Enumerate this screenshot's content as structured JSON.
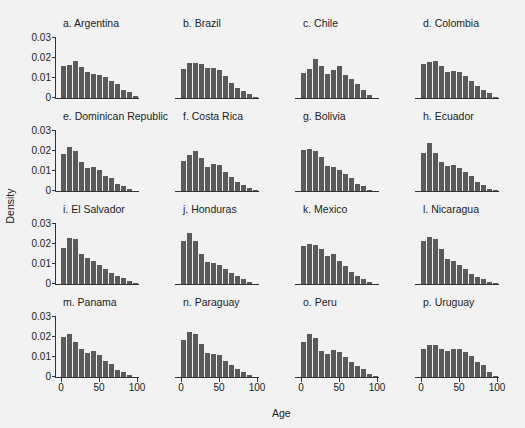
{
  "chart_data": {
    "type": "bar",
    "title": "",
    "xlabel": "Age",
    "ylabel": "Density",
    "ylim": [
      0,
      0.03
    ],
    "xlim": [
      0,
      100
    ],
    "yticks": [
      "0.03",
      "0.02",
      "0.01",
      "0"
    ],
    "xticks": [
      "0",
      "50",
      "100"
    ],
    "bin_width": 7.5,
    "panels": [
      {
        "label": "a. Argentina",
        "values": [
          0.0158,
          0.0163,
          0.0185,
          0.0157,
          0.013,
          0.0122,
          0.0115,
          0.0105,
          0.0085,
          0.0068,
          0.004,
          0.003,
          0.001
        ]
      },
      {
        "label": "b. Brazil",
        "values": [
          0.0145,
          0.0175,
          0.0175,
          0.0168,
          0.015,
          0.015,
          0.014,
          0.011,
          0.0075,
          0.005,
          0.0035,
          0.002,
          0.0005
        ]
      },
      {
        "label": "c. Chile",
        "values": [
          0.0125,
          0.0145,
          0.0195,
          0.016,
          0.0122,
          0.0138,
          0.016,
          0.0115,
          0.0095,
          0.0068,
          0.004,
          0.0015,
          0.0002
        ]
      },
      {
        "label": "d. Colombia",
        "values": [
          0.017,
          0.018,
          0.0185,
          0.0158,
          0.013,
          0.0135,
          0.013,
          0.011,
          0.0085,
          0.0062,
          0.004,
          0.0025,
          0.0005
        ]
      },
      {
        "label": "e. Dominican Republic",
        "values": [
          0.0185,
          0.022,
          0.02,
          0.0145,
          0.0115,
          0.0118,
          0.0105,
          0.0075,
          0.0065,
          0.0035,
          0.0025,
          0.001,
          0.0002
        ]
      },
      {
        "label": "f. Costa Rica",
        "values": [
          0.015,
          0.018,
          0.02,
          0.0165,
          0.012,
          0.0135,
          0.013,
          0.0095,
          0.007,
          0.0045,
          0.003,
          0.0015,
          0.0003
        ]
      },
      {
        "label": "g. Bolivia",
        "values": [
          0.0205,
          0.021,
          0.02,
          0.017,
          0.0125,
          0.012,
          0.0105,
          0.0085,
          0.0065,
          0.0035,
          0.0025,
          0.0005,
          0
        ]
      },
      {
        "label": "h. Ecuador",
        "values": [
          0.019,
          0.024,
          0.019,
          0.0145,
          0.0125,
          0.013,
          0.0115,
          0.0095,
          0.0075,
          0.0045,
          0.003,
          0.0012,
          0.0003
        ]
      },
      {
        "label": "i. El Salvador",
        "values": [
          0.018,
          0.023,
          0.0225,
          0.015,
          0.013,
          0.0115,
          0.0095,
          0.0075,
          0.0055,
          0.004,
          0.003,
          0.0015,
          0.0005
        ]
      },
      {
        "label": "j. Honduras",
        "values": [
          0.0215,
          0.0255,
          0.0215,
          0.015,
          0.011,
          0.0105,
          0.0095,
          0.0075,
          0.0055,
          0.004,
          0.0025,
          0.001,
          0.0002
        ]
      },
      {
        "label": "k. Mexico",
        "values": [
          0.019,
          0.02,
          0.0195,
          0.0175,
          0.014,
          0.015,
          0.0115,
          0.009,
          0.006,
          0.004,
          0.0025,
          0.001,
          0.0002
        ]
      },
      {
        "label": "l. Nicaragua",
        "values": [
          0.0215,
          0.0235,
          0.0225,
          0.0175,
          0.0125,
          0.0115,
          0.0095,
          0.0075,
          0.005,
          0.0035,
          0.0025,
          0.001,
          0.0003
        ]
      },
      {
        "label": "m. Panama",
        "values": [
          0.02,
          0.0215,
          0.0175,
          0.014,
          0.012,
          0.0128,
          0.011,
          0.008,
          0.0065,
          0.0035,
          0.0025,
          0.001,
          0.0002
        ]
      },
      {
        "label": "n. Paraguay",
        "values": [
          0.0185,
          0.0225,
          0.0215,
          0.0165,
          0.012,
          0.0115,
          0.011,
          0.008,
          0.006,
          0.004,
          0.0025,
          0.0012,
          0.0002
        ]
      },
      {
        "label": "o. Peru",
        "values": [
          0.0175,
          0.0215,
          0.0195,
          0.013,
          0.0115,
          0.0135,
          0.0125,
          0.01,
          0.0075,
          0.0055,
          0.004,
          0.0015,
          0.0003
        ]
      },
      {
        "label": "p. Uruguay",
        "values": [
          0.014,
          0.016,
          0.016,
          0.014,
          0.013,
          0.0138,
          0.0138,
          0.0125,
          0.0105,
          0.0075,
          0.0062,
          0.0025,
          0.0005
        ]
      }
    ],
    "bar_color": "#5a5a5a",
    "grid": false,
    "layout": {
      "rows": 4,
      "cols": 4
    }
  }
}
